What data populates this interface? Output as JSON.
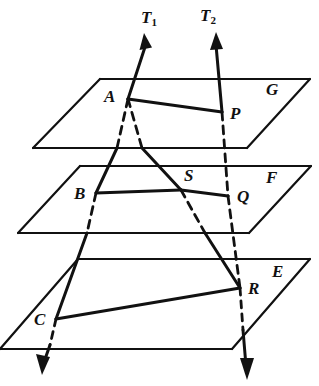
{
  "figure": {
    "width": 319,
    "height": 386,
    "background_color": "#ffffff",
    "ink_color": "#111111"
  },
  "labels": {
    "vector_t1": "T",
    "vector_t1_sub": "1",
    "vector_t2": "T",
    "vector_t2_sub": "2",
    "plane_g": "G",
    "plane_f": "F",
    "plane_e": "E",
    "point_a": "A",
    "point_p": "P",
    "point_b": "B",
    "point_s": "S",
    "point_q": "Q",
    "point_c": "C",
    "point_r": "R"
  },
  "geometry": {
    "planes": [
      {
        "name": "G",
        "label": "G",
        "label_x": 266,
        "label_y": 81,
        "outline": "100,79 310,79 247,148 33,148"
      },
      {
        "name": "F",
        "label": "F",
        "label_x": 266,
        "label_y": 169,
        "outline": "80,166 311,166 249,233 18,233"
      },
      {
        "name": "E",
        "label": "E",
        "label_x": 272,
        "label_y": 263,
        "outline": "78,259 310,259 232,349 0,349"
      }
    ],
    "points": [
      {
        "id": "A",
        "x": 128,
        "y": 99,
        "label_x": 104,
        "label_y": 88
      },
      {
        "id": "P",
        "x": 222,
        "y": 112,
        "label_x": 230,
        "label_y": 105
      },
      {
        "id": "B",
        "x": 96,
        "y": 193,
        "label_x": 74,
        "label_y": 185
      },
      {
        "id": "S",
        "x": 181,
        "y": 190,
        "label_x": 184,
        "label_y": 167
      },
      {
        "id": "Q",
        "x": 228,
        "y": 196,
        "label_x": 237,
        "label_y": 188
      },
      {
        "id": "C",
        "x": 56,
        "y": 319,
        "label_x": 34,
        "label_y": 311
      },
      {
        "id": "R",
        "x": 240,
        "y": 288,
        "label_x": 248,
        "label_y": 280
      }
    ],
    "transversal_t1": {
      "arrow_tip": "144,35",
      "path_down": "144,35 128,99 96,193 56,319 43,372",
      "arrow_tail_tip": "43,372"
    },
    "transversal_t2": {
      "arrow_tip": "216,33",
      "path_down": "216,33 222,112 228,196 240,288 246,378",
      "arrow_tail_tip": "246,378"
    },
    "segments_solid": [
      {
        "from": "A",
        "to": "P",
        "note": "chord in plane G"
      },
      {
        "from": "B",
        "to": "S",
        "note": "chord in plane F"
      },
      {
        "from": "S",
        "to": "Q",
        "note": "chord in plane F"
      },
      {
        "from": "C",
        "to": "R",
        "note": "chord in plane E"
      }
    ],
    "segments_dashed": [
      {
        "from": "A",
        "to": "B",
        "note": "hidden behind plane G"
      },
      {
        "from": "A",
        "to": "S",
        "note": "hidden behind plane G"
      },
      {
        "from": "B",
        "to": "C",
        "note": "hidden behind plane F"
      },
      {
        "from": "S",
        "to": "R",
        "note": "hidden behind plane F"
      },
      {
        "from": "P",
        "to": "Q",
        "note": "hidden behind plane G"
      },
      {
        "from": "Q",
        "to": "R",
        "note": "hidden behind plane F"
      },
      {
        "from": "C",
        "to": "arrow",
        "note": "hidden behind plane E"
      },
      {
        "from": "R",
        "to": "arrow",
        "note": "hidden behind plane E"
      }
    ]
  }
}
